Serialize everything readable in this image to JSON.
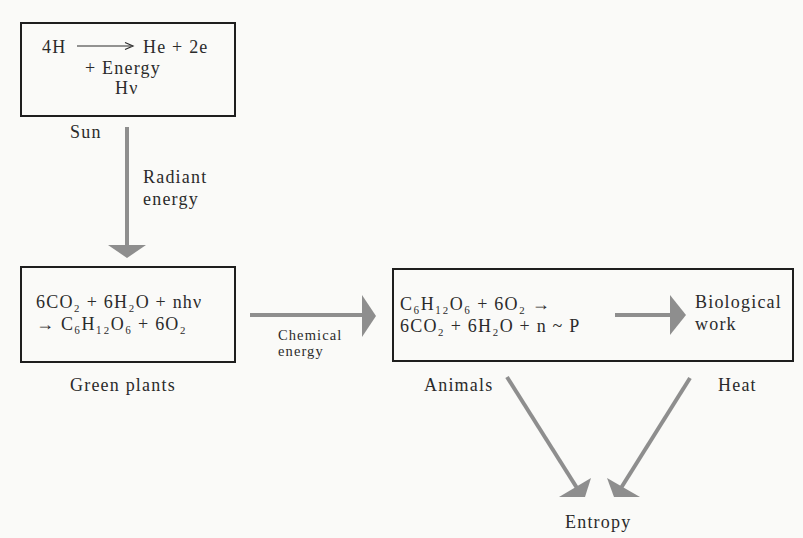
{
  "colors": {
    "arrow": "#8e8e8e",
    "border": "#1e1e1e",
    "text": "#2b2b2b",
    "bg": "#fafaf8"
  },
  "sun_box": {
    "reaction_reactant": "4H",
    "reaction_products": "He + 2e",
    "reaction_line2": "+ Energy",
    "reaction_line3": "Hν",
    "label": "Sun"
  },
  "radiant_arrow": {
    "label_line1": "Radiant",
    "label_line2": "energy"
  },
  "plants_box": {
    "reaction_line1": "6CO₂ + 6H₂O + nhν",
    "reaction_line2": "→ C₆H₁₂O₆ + 6O₂",
    "label": "Green plants"
  },
  "chemical_arrow": {
    "label_line1": "Chemical",
    "label_line2": "energy"
  },
  "animals_box": {
    "reaction_line1": "C₆H₁₂O₆ + 6O₂ →",
    "reaction_line2": "6CO₂ + 6H₂O + n ~ P",
    "output_line1": "Biological",
    "output_line2": "work",
    "label": "Animals"
  },
  "heat_label": "Heat",
  "entropy_label": "Entropy"
}
